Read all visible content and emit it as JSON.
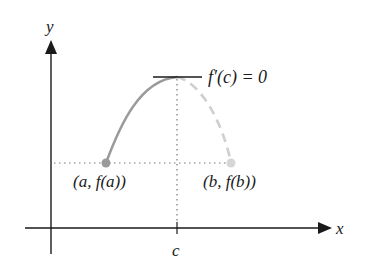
{
  "diagram": {
    "type": "rolle-theorem-mean-value",
    "axes": {
      "x_label": "x",
      "y_label": "y",
      "tick_label": "c"
    },
    "labels": {
      "point_a": "(a, f(a))",
      "point_b": "(b, f(b))",
      "tangent": "f′(c) = 0"
    },
    "colors": {
      "axis": "#1a1a1a",
      "curve_solid": "#9a9a9a",
      "curve_dashed": "#cfcfcf",
      "guide_dotted": "#777777",
      "point_a": "#9a9a9a",
      "point_b": "#d6d6d6",
      "tangent": "#1a1a1a"
    }
  }
}
